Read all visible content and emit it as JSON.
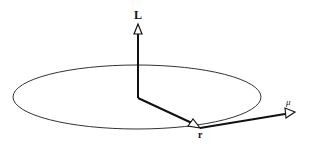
{
  "diagram": {
    "labels": {
      "angular_momentum": "L",
      "position": "r",
      "magnetic_moment": "μ"
    },
    "colors": {
      "stroke": "#111111",
      "orbit": "#333333",
      "background": "#ffffff"
    }
  }
}
